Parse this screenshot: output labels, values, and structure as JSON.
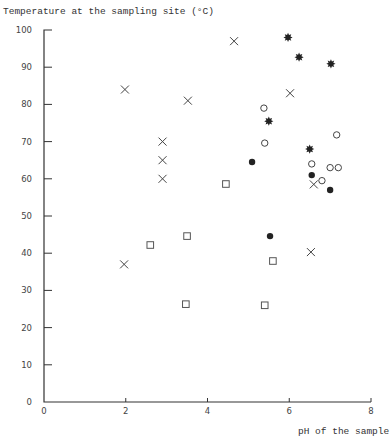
{
  "chart_data": {
    "type": "scatter",
    "title": "",
    "ylabel": "Temperature at the sampling site (°C)",
    "xlabel": "pH of the sample",
    "xlim": [
      0,
      8
    ],
    "ylim": [
      0,
      100
    ],
    "x_ticks": [
      0,
      2,
      4,
      6,
      8
    ],
    "y_ticks": [
      0,
      10,
      20,
      30,
      40,
      50,
      60,
      70,
      80,
      90,
      100
    ],
    "grid": false,
    "legend": null,
    "series": [
      {
        "name": "cross",
        "marker": "x",
        "points": [
          {
            "x": 1.98,
            "y": 84
          },
          {
            "x": 3.52,
            "y": 81
          },
          {
            "x": 4.65,
            "y": 97
          },
          {
            "x": 6.02,
            "y": 83
          },
          {
            "x": 2.9,
            "y": 70
          },
          {
            "x": 2.9,
            "y": 65
          },
          {
            "x": 2.9,
            "y": 60
          },
          {
            "x": 1.96,
            "y": 37
          },
          {
            "x": 6.6,
            "y": 58.5
          },
          {
            "x": 6.53,
            "y": 40.3
          }
        ]
      },
      {
        "name": "star",
        "marker": "star",
        "points": [
          {
            "x": 5.97,
            "y": 98
          },
          {
            "x": 6.24,
            "y": 92.7
          },
          {
            "x": 7.02,
            "y": 90.9
          },
          {
            "x": 5.5,
            "y": 75.5
          },
          {
            "x": 6.5,
            "y": 68
          }
        ]
      },
      {
        "name": "open-circle",
        "marker": "open-circle",
        "points": [
          {
            "x": 5.38,
            "y": 79
          },
          {
            "x": 5.4,
            "y": 69.6
          },
          {
            "x": 7.16,
            "y": 71.8
          },
          {
            "x": 6.55,
            "y": 64
          },
          {
            "x": 7.0,
            "y": 63
          },
          {
            "x": 7.2,
            "y": 63
          },
          {
            "x": 6.8,
            "y": 59.5
          }
        ]
      },
      {
        "name": "filled-circle",
        "marker": "filled-circle",
        "points": [
          {
            "x": 5.09,
            "y": 64.5
          },
          {
            "x": 6.55,
            "y": 61
          },
          {
            "x": 7.0,
            "y": 57
          },
          {
            "x": 5.53,
            "y": 44.6
          }
        ]
      },
      {
        "name": "open-square",
        "marker": "open-square",
        "points": [
          {
            "x": 4.45,
            "y": 58.6
          },
          {
            "x": 3.5,
            "y": 44.6
          },
          {
            "x": 2.6,
            "y": 42.2
          },
          {
            "x": 5.6,
            "y": 37.9
          },
          {
            "x": 3.47,
            "y": 26.3
          },
          {
            "x": 5.4,
            "y": 26
          }
        ]
      }
    ]
  },
  "labels": {
    "ylabel": "Temperature at the sampling site (°C)",
    "xlabel": "pH of the sample"
  },
  "colors": {
    "ink": "#222222",
    "axis": "#333333",
    "background": "#ffffff"
  }
}
